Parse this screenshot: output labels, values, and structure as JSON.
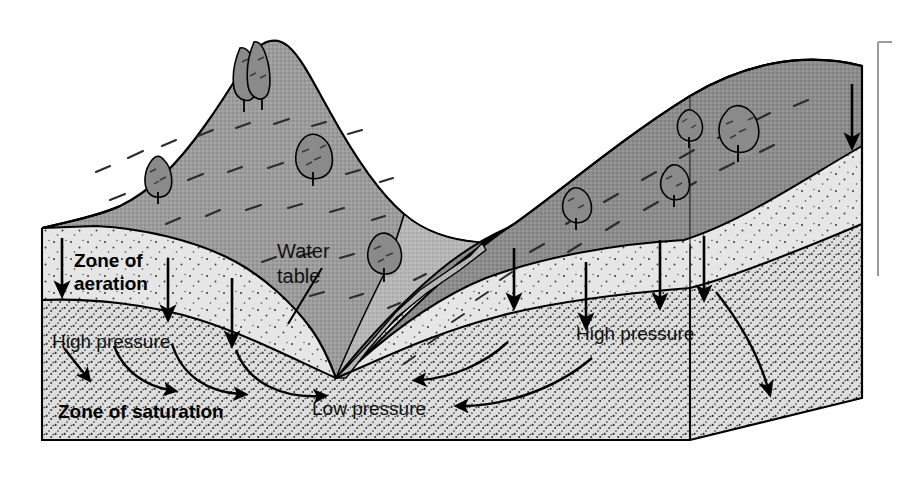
{
  "figure": {
    "kind": "block-diagram",
    "background_color": "#ffffff"
  },
  "labels": {
    "zone_of_aeration": "Zone of\naeration",
    "zone_of_aeration_line1": "Zone of",
    "zone_of_aeration_line2": "aeration",
    "water_table_line1": "Water",
    "water_table_line2": "table",
    "zone_of_saturation": "Zone of saturation",
    "high_pressure_left": "High pressure",
    "high_pressure_right": "High pressure",
    "low_pressure": "Low pressure"
  },
  "colors": {
    "outline": "#000000",
    "hill_surface": "#9a9a9a",
    "hill_surface_dark": "#8a8a8a",
    "aeration_fill": "#e3e3e3",
    "saturation_fill": "#dcdcdc",
    "valley_slope": "#d0d0d0",
    "tree_fill": "#8f8f8f",
    "tree_shadow": "#9f9f9f",
    "margin_rule": "#9b9b9b",
    "text": "#000000"
  },
  "annotations": {
    "infiltration_arrows_left": 3,
    "infiltration_arrows_right": 5,
    "flow_arrows_left": 4,
    "flow_arrows_right": 3,
    "trees_total": 9
  },
  "margin_rule": {
    "present": true,
    "orientation": "vertical-bracket-right",
    "x": 878,
    "y_top": 42,
    "y_bottom": 276
  }
}
